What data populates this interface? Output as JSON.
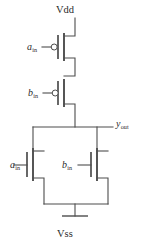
{
  "diagram": {
    "type": "transistor-level-schematic",
    "background_color": "#ffffff",
    "line_color": "#4d4d4d",
    "text_color": "#2b2b2b"
  },
  "labels": {
    "vdd": "Vdd",
    "vss": "Vss",
    "pmos_a_base": "a",
    "pmos_a_sub": "in",
    "pmos_b_base": "b",
    "pmos_b_sub": "in",
    "nmos_a_base": "a",
    "nmos_a_sub": "in",
    "nmos_b_base": "b",
    "nmos_b_sub": "in",
    "yout_base": "y",
    "yout_sub": "out"
  },
  "nets": {
    "supply_top": "Vdd",
    "supply_bottom": "Vss",
    "output": "y_out",
    "input_a": "a_in",
    "input_b": "b_in"
  },
  "devices": [
    {
      "id": "pmos-a",
      "kind": "pmos",
      "gate_net": "a_in",
      "has_inversion_bubble": true,
      "source_net": "Vdd",
      "drain_net": "internal_1"
    },
    {
      "id": "pmos-b",
      "kind": "pmos",
      "gate_net": "b_in",
      "has_inversion_bubble": true,
      "source_net": "internal_1",
      "drain_net": "y_out"
    },
    {
      "id": "nmos-a",
      "kind": "nmos",
      "gate_net": "a_in",
      "has_inversion_bubble": false,
      "drain_net": "y_out",
      "source_net": "Vss"
    },
    {
      "id": "nmos-b",
      "kind": "nmos",
      "gate_net": "b_in",
      "has_inversion_bubble": false,
      "drain_net": "y_out",
      "source_net": "Vss"
    }
  ]
}
